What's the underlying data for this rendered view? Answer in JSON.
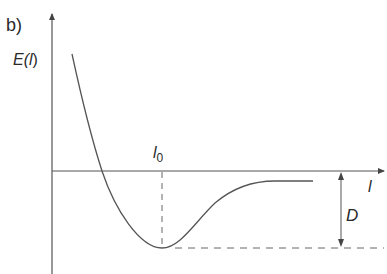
{
  "figure": {
    "panel_label": "b)",
    "y_axis_label_main": "E(",
    "y_axis_label_var": "l",
    "y_axis_label_close": ")",
    "x_axis_label": "l",
    "equilibrium_label_main": "l",
    "equilibrium_label_sub": "0",
    "depth_label": "D",
    "colors": {
      "line": "#555555",
      "text": "#2a2a2a",
      "background": "#ffffff"
    }
  }
}
